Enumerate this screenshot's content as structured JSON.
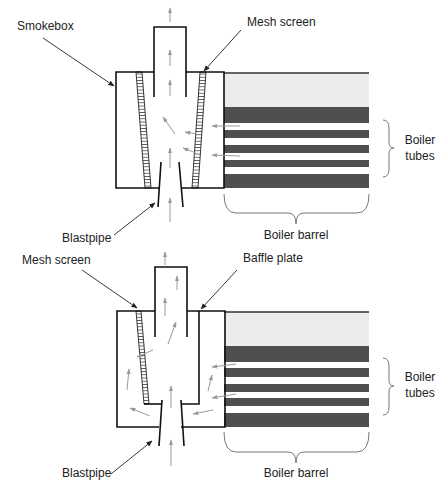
{
  "colors": {
    "outline": "#111111",
    "boiler_light": "#ececec",
    "boiler_dark": "#4f4f4f",
    "flow_arrow": "#9a9a9a",
    "brace": "#777777",
    "text": "#222222"
  },
  "top_diagram": {
    "labels": {
      "smokebox": "Smokebox",
      "mesh_screen": "Mesh screen",
      "blastpipe": "Blastpipe",
      "boiler_tubes_line1": "Boiler",
      "boiler_tubes_line2": "tubes",
      "boiler_barrel": "Boiler barrel"
    }
  },
  "bottom_diagram": {
    "labels": {
      "mesh_screen": "Mesh screen",
      "baffle_plate": "Baffle plate",
      "blastpipe": "Blastpipe",
      "boiler_tubes_line1": "Boiler",
      "boiler_tubes_line2": "tubes",
      "boiler_barrel": "Boiler barrel"
    }
  }
}
